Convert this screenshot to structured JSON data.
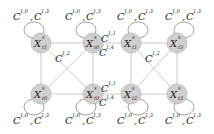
{
  "nodes": [
    {
      "id": "n1",
      "label": "X",
      "sup": "s",
      "sub": "t1",
      "cx": 41,
      "cy": 43
    },
    {
      "id": "n2",
      "label": "X",
      "sup": "s",
      "sub": "t0",
      "cx": 93,
      "cy": 43
    },
    {
      "id": "n3",
      "label": "X",
      "sup": "s",
      "sub": "t1",
      "cx": 131,
      "cy": 43
    },
    {
      "id": "n4",
      "label": "X",
      "sup": "s",
      "sub": "t3",
      "cx": 177,
      "cy": 43
    },
    {
      "id": "n5",
      "label": "X",
      "sup": "s",
      "sub": "t0",
      "cx": 41,
      "cy": 94
    },
    {
      "id": "n6",
      "label": "X",
      "sup": "s",
      "sub": "t0",
      "cx": 93,
      "cy": 94
    },
    {
      "id": "n7",
      "label": "X",
      "sup": "s",
      "sub": "t2",
      "cx": 131,
      "cy": 94
    },
    {
      "id": "n8",
      "label": "X",
      "sup": "s",
      "sub": "t3",
      "cx": 177,
      "cy": 94
    }
  ],
  "edge_labels": {
    "top_left_loop": [
      "C^{1,0}",
      "C^{1,3}"
    ],
    "top_mid_loop": [
      "C^{1,0}",
      "C^{1,3}"
    ],
    "top_mid2_loop": [
      "C^{1,0}",
      "C^{1,3}"
    ],
    "top_right_loop": [
      "C^{1,0}",
      "C^{1,3}"
    ],
    "bottom_left_loop": [
      "C^{1,0}",
      "C^{1,3}"
    ],
    "bottom_mid_loop": [
      "C^{1,0}",
      "C^{1,3}"
    ],
    "bottom_mid2_loop": [
      "C^{1,0}",
      "C^{1,3}"
    ],
    "bottom_right_loop": [
      "C^{1,0}",
      "C^{1,3}"
    ],
    "left_cross": "C^{1,2}",
    "right_cross": "C^{1,2}",
    "middle_top_upper": "C^{1,1}",
    "middle_top_lower": "C^{1,4}",
    "middle_bottom_upper": "C^{1,1}",
    "middle_bottom_lower": "C^{1,4}"
  },
  "text": {
    "C": "C",
    "sep": ",",
    "s10": "1,0",
    "s13": "1,3",
    "s12": "1,2",
    "s11": "1,1",
    "s14": "1,4"
  }
}
